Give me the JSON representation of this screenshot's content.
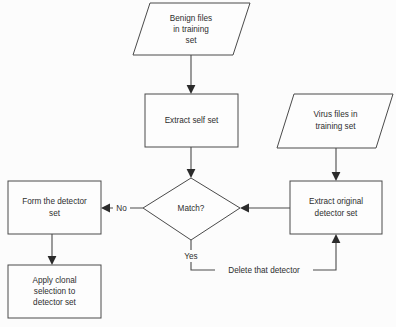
{
  "diagram": {
    "background_color": "#fcfcfc",
    "line_color": "#4a4a4a",
    "text_color": "#2e2e2e",
    "nodes": [
      {
        "id": "benign-files",
        "shape": "parallelogram",
        "lines": [
          "Benign files",
          "in training",
          "set"
        ]
      },
      {
        "id": "extract-self-set",
        "shape": "rectangle",
        "lines": [
          "Extract self set"
        ]
      },
      {
        "id": "virus-files",
        "shape": "parallelogram",
        "lines": [
          "Virus files in",
          "training set"
        ]
      },
      {
        "id": "extract-original-detector-set",
        "shape": "rectangle",
        "lines": [
          "Extract original",
          "detector set"
        ]
      },
      {
        "id": "match-decision",
        "shape": "diamond",
        "lines": [
          "Match?"
        ]
      },
      {
        "id": "form-the-detector-set",
        "shape": "rectangle",
        "lines": [
          "Form the detector",
          "set"
        ]
      },
      {
        "id": "apply-clonal-selection",
        "shape": "rectangle",
        "lines": [
          "Apply clonal",
          "selection to",
          "detector set"
        ]
      }
    ],
    "edge_labels": {
      "no": "No",
      "yes": "Yes",
      "delete_that_detector": "Delete that detector"
    }
  }
}
